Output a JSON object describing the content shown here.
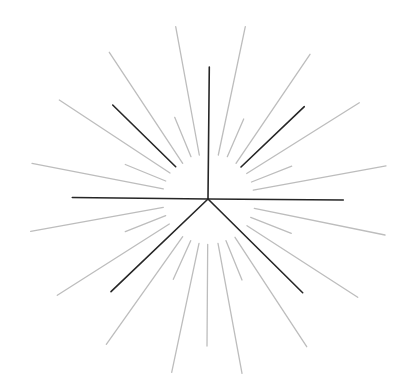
{
  "diagram": {
    "type": "radial-burst",
    "center": [
      208,
      199
    ],
    "colors": {
      "background": "#ffffff",
      "dark": "#262626",
      "gray": "#bdbdbd"
    },
    "dark_rays": [
      {
        "id": "up",
        "x1": 208,
        "y1": 199,
        "x2": 209.3,
        "y2": 67
      },
      {
        "id": "left",
        "x1": 208,
        "y1": 199,
        "x2": 72.3,
        "y2": 197.5
      },
      {
        "id": "right",
        "x1": 208,
        "y1": 199,
        "x2": 343.3,
        "y2": 200
      },
      {
        "id": "upper-left",
        "x1": 175.7,
        "y1": 166.7,
        "x2": 112.7,
        "y2": 105
      },
      {
        "id": "upper-right",
        "x1": 241,
        "y1": 167,
        "x2": 304.3,
        "y2": 106.7
      },
      {
        "id": "lower-left",
        "x1": 208,
        "y1": 199,
        "x2": 111,
        "y2": 291.7
      },
      {
        "id": "lower-right",
        "x1": 208,
        "y1": 199,
        "x2": 302.7,
        "y2": 292.7
      }
    ],
    "gray_rays": [
      {
        "x1": 199.3,
        "y1": 155,
        "x2": 175.7,
        "y2": 26.7
      },
      {
        "x1": 218.3,
        "y1": 155,
        "x2": 245.3,
        "y2": 26.7
      },
      {
        "x1": 182.7,
        "y1": 163.3,
        "x2": 109.3,
        "y2": 52.3
      },
      {
        "x1": 236,
        "y1": 163.3,
        "x2": 310,
        "y2": 54.3
      },
      {
        "x1": 170,
        "y1": 173,
        "x2": 59.3,
        "y2": 100
      },
      {
        "x1": 246.7,
        "y1": 173.5,
        "x2": 359.3,
        "y2": 102.8
      },
      {
        "x1": 191,
        "y1": 156.7,
        "x2": 174.7,
        "y2": 117.3
      },
      {
        "x1": 227.3,
        "y1": 156.7,
        "x2": 243.7,
        "y2": 119
      },
      {
        "x1": 163.3,
        "y1": 188.8,
        "x2": 32,
        "y2": 163.3
      },
      {
        "x1": 253.3,
        "y1": 190.2,
        "x2": 386,
        "y2": 165.8
      },
      {
        "x1": 165.7,
        "y1": 181,
        "x2": 125.3,
        "y2": 164.5
      },
      {
        "x1": 251.5,
        "y1": 182,
        "x2": 291.7,
        "y2": 166.2
      },
      {
        "x1": 163.3,
        "y1": 207.3,
        "x2": 30.7,
        "y2": 231.3
      },
      {
        "x1": 254.3,
        "y1": 208.3,
        "x2": 385,
        "y2": 235
      },
      {
        "x1": 165.7,
        "y1": 215.7,
        "x2": 125.3,
        "y2": 231.7
      },
      {
        "x1": 250.7,
        "y1": 217.3,
        "x2": 291.3,
        "y2": 233.3
      },
      {
        "x1": 169.3,
        "y1": 224,
        "x2": 57.3,
        "y2": 295.3
      },
      {
        "x1": 247,
        "y1": 225.7,
        "x2": 357.7,
        "y2": 297.3
      },
      {
        "x1": 182.7,
        "y1": 236.7,
        "x2": 106.3,
        "y2": 344.3
      },
      {
        "x1": 235,
        "y1": 237.3,
        "x2": 306.7,
        "y2": 346.7
      },
      {
        "x1": 199,
        "y1": 243.3,
        "x2": 171.7,
        "y2": 372.3
      },
      {
        "x1": 218,
        "y1": 243.3,
        "x2": 242,
        "y2": 373.3
      },
      {
        "x1": 207.7,
        "y1": 244.3,
        "x2": 207,
        "y2": 346
      },
      {
        "x1": 190.7,
        "y1": 240.7,
        "x2": 173.3,
        "y2": 279.3
      },
      {
        "x1": 226,
        "y1": 240.7,
        "x2": 242,
        "y2": 280
      }
    ]
  }
}
